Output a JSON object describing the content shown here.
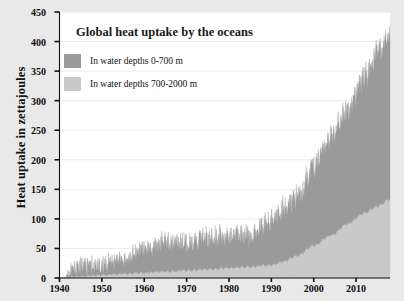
{
  "chart_data": {
    "type": "area",
    "title": "Global heat uptake by the oceans",
    "xlabel": "",
    "ylabel": "Heat uptake in zettajoules",
    "xlim": [
      1940,
      2018
    ],
    "ylim": [
      0,
      450
    ],
    "grid": true,
    "stacked": true,
    "legend_position": "upper-left-inside",
    "x_ticks": [
      1940,
      1950,
      1960,
      1970,
      1980,
      1990,
      2000,
      2010
    ],
    "y_ticks": [
      0,
      50,
      100,
      150,
      200,
      250,
      300,
      350,
      400,
      450
    ],
    "series": [
      {
        "name": "In water depths 700-2000 m",
        "color": "#c9c9c9",
        "note": "lower band of the stack",
        "x": [
          1940,
          1945,
          1950,
          1955,
          1960,
          1965,
          1970,
          1975,
          1980,
          1985,
          1990,
          1993,
          1996,
          2000,
          2004,
          2008,
          2012,
          2015,
          2018
        ],
        "values": [
          0,
          3,
          5,
          7,
          9,
          11,
          13,
          15,
          17,
          19,
          22,
          28,
          38,
          55,
          72,
          92,
          110,
          122,
          133
        ]
      },
      {
        "name": "In water depths 0-700 m",
        "color": "#9a9a9a",
        "note": "upper band of the stack; plotted on top of the 700-2000 m band",
        "x": [
          1940,
          1945,
          1950,
          1955,
          1960,
          1965,
          1970,
          1975,
          1980,
          1985,
          1990,
          1993,
          1996,
          2000,
          2004,
          2008,
          2012,
          2015,
          2018
        ],
        "values": [
          0,
          22,
          20,
          30,
          45,
          55,
          50,
          58,
          62,
          58,
          80,
          95,
          105,
          140,
          170,
          200,
          235,
          265,
          290
        ]
      }
    ],
    "total_stack": {
      "name": "Total 0-2000 m heat uptake",
      "x": [
        1940,
        1950,
        1960,
        1970,
        1980,
        1990,
        2000,
        2010,
        2018
      ],
      "values": [
        0,
        25,
        54,
        63,
        79,
        102,
        195,
        330,
        423
      ],
      "peak_value": 430
    },
    "noise": {
      "description": "Data are high-frequency (monthly) and appear as dense vertical spikes; amplitude grows with the signal.",
      "amplitude_start": 18,
      "amplitude_end": 26
    }
  },
  "axes": {
    "y_label": "Heat uptake in zettajoules",
    "y_tick_labels": [
      "450",
      "400",
      "350",
      "300",
      "250",
      "200",
      "150",
      "100",
      "50",
      "0"
    ],
    "x_tick_labels": [
      "1940",
      "1950",
      "1960",
      "1970",
      "1980",
      "1990",
      "2000",
      "2010"
    ]
  },
  "title": "Global heat uptake by the oceans",
  "legend": {
    "items": [
      {
        "label": "In water depths 0-700 m",
        "color": "#9a9a9a"
      },
      {
        "label": "In water depths 700-2000 m",
        "color": "#c9c9c9"
      }
    ]
  },
  "colors": {
    "shallow_band": "#9a9a9a",
    "deep_band": "#c9c9c9",
    "canvas": "#ffffff",
    "page": "#e9e9e9",
    "axis": "#101010",
    "grid": "#e6e6e6"
  }
}
